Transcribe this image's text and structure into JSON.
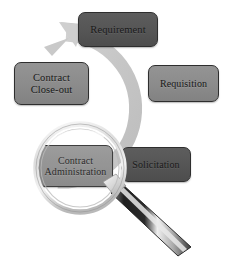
{
  "diagram": {
    "background_color": "#ffffff",
    "ring": {
      "name": "circular-arrow-ring",
      "color": "#c9c9c9",
      "direction": "clockwise",
      "arrow_target": "Requirement"
    },
    "palette": {
      "dark_node": "#555555",
      "light_node": "#8b8b8b",
      "node_border": "#2e2e2e",
      "ring": "#c9c9c9",
      "handle_dark": "#262626",
      "handle_light": "#d5d5d5"
    },
    "nodes": [
      {
        "id": "requirement",
        "label": "Requirement",
        "shade": "dark",
        "position": "top"
      },
      {
        "id": "requisition",
        "label": "Requisition",
        "shade": "light",
        "position": "right-upper"
      },
      {
        "id": "solicitation",
        "label": "Solicitation",
        "shade": "dark",
        "position": "right-lower"
      },
      {
        "id": "administration",
        "label": "Contract\nAdministration",
        "label_line1": "Contract",
        "label_line2": "Administration",
        "shade": "light",
        "position": "bottom-left"
      },
      {
        "id": "closeout",
        "label": "Contract\nClose-out",
        "label_line1": "Contract",
        "label_line2": "Close-out",
        "shade": "light",
        "position": "left"
      }
    ],
    "magnifier": {
      "name": "magnifying-glass",
      "focus_on": "Contract Administration",
      "lens_center": [
        80,
        168
      ],
      "lens_radius": 44,
      "handle_angle_deg": 43
    }
  }
}
